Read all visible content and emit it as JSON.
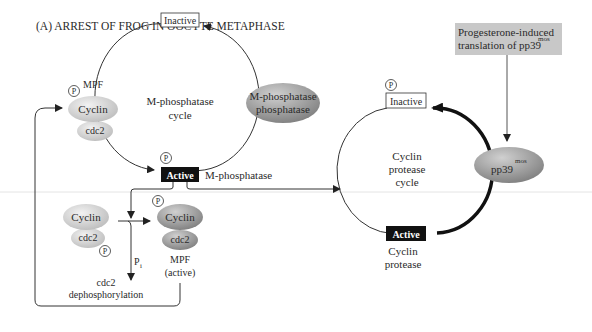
{
  "title": "(A)  ARREST OF FROG IN OOCYTE METAPHASE",
  "colors": {
    "ellipse_light": "#d6d6d6",
    "ellipse_dark": "#9e9e9e",
    "box_gray": "#c8c8c8",
    "active_fill": "#111111",
    "line": "#2a2a2a",
    "separator": "#e2e2e2"
  },
  "m_phosphatase_cycle": {
    "label_line1": "M-phosphatase",
    "label_line2": "cycle",
    "inactive_label": "Inactive",
    "active_label": "Active",
    "active_side_label": "M-phosphatase",
    "phosphate": "P"
  },
  "m_phosphatase_phosphatase": {
    "line1": "M-phosphatase",
    "line2": "phosphatase"
  },
  "mpf_top": {
    "phosphate": "P",
    "mpf_label": "MPF",
    "cyclin": "Cyclin",
    "cdc2": "cdc2"
  },
  "mpf_inactive": {
    "cyclin": "Cyclin",
    "cdc2": "cdc2",
    "phosphate": "P"
  },
  "mpf_active": {
    "phosphate": "P",
    "cyclin": "Cyclin",
    "cdc2": "cdc2",
    "label_line1": "MPF",
    "label_line2": "(active)"
  },
  "dephosphorylation": {
    "pi": "P",
    "pi_sub": "i",
    "line1": "cdc2",
    "line2": "dephosphorylation"
  },
  "cyclin_protease_cycle": {
    "label_line1": "Cyclin",
    "label_line2": "protease",
    "label_line3": "cycle",
    "inactive_label": "Inactive",
    "phosphate": "P",
    "active_label": "Active",
    "active_sub_line1": "Cyclin",
    "active_sub_line2": "protease"
  },
  "progesterone_box": {
    "line1": "Progesterone-induced",
    "line2": "translation of pp39",
    "superscript": "mos"
  },
  "pp39": {
    "label": "pp39",
    "superscript": "mos"
  }
}
